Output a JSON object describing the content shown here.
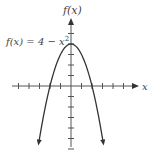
{
  "chart_data": {
    "type": "line",
    "title": "",
    "function_label": "f(x) = 4 − x²",
    "xlabel": "x",
    "ylabel": "f(x)",
    "xlim": [
      -5,
      5
    ],
    "ylim": [
      -6,
      5
    ],
    "x_ticks": [
      -5,
      -4,
      -3,
      -2,
      -1,
      1,
      2,
      3,
      4,
      5
    ],
    "y_ticks": [
      -6,
      -5,
      -4,
      -3,
      -2,
      -1,
      1,
      2,
      3,
      4,
      5
    ],
    "grid": false,
    "series": [
      {
        "name": "f(x) = 4 - x^2",
        "x": [
          -3.1,
          -3,
          -2.5,
          -2,
          -1.5,
          -1,
          -0.5,
          0,
          0.5,
          1,
          1.5,
          2,
          2.5,
          3,
          3.1
        ],
        "y": [
          -5.61,
          -5,
          -2.25,
          0,
          1.75,
          3,
          3.75,
          4,
          3.75,
          3,
          1.75,
          0,
          -2.25,
          -5,
          -5.61
        ]
      }
    ],
    "annotations": [
      "vertex at (0, 4)",
      "roots at x = -2 and x = 2",
      "arrows at curve ends"
    ]
  },
  "labels": {
    "function": "f(x) = 4 − x",
    "function_exp": "2",
    "y_axis": "f(x)",
    "x_axis": "x"
  },
  "colors": {
    "axis": "#555555",
    "curve": "#333333",
    "text": "#444444"
  }
}
